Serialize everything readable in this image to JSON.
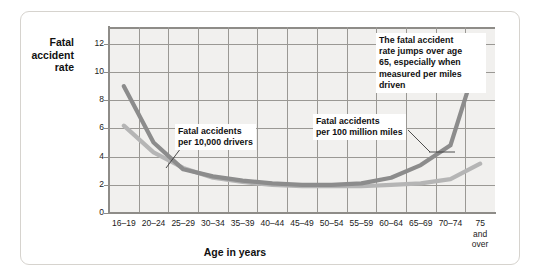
{
  "figure": {
    "y_axis_title": "Fatal\naccident\nrate",
    "x_axis_title": "Age in years"
  },
  "annotations": {
    "drivers": "Fatal accidents\nper 10,000 drivers",
    "miles": "Fatal accidents\nper 100 million miles",
    "jump": "The fatal accident\nrate jumps over age\n65, especially when\nmeasured per miles\ndriven"
  },
  "colors": {
    "series_miles": "#8c8c8c",
    "series_drivers": "#b5b5b5",
    "plot_background": "#f1f0ee",
    "grid": "#9a9894",
    "axis": "#8e8c88",
    "card_border": "#d6d3ce"
  },
  "chart_data": {
    "type": "line",
    "title": "",
    "xlabel": "Age in years",
    "ylabel": "Fatal accident rate",
    "ylim": [
      0,
      13.2
    ],
    "yticks": [
      0,
      2,
      4,
      6,
      8,
      10,
      12
    ],
    "grid": true,
    "legend": "annotated-callouts",
    "categories": [
      "16–19",
      "20–24",
      "25–29",
      "30–34",
      "35–39",
      "40–44",
      "45–49",
      "50–54",
      "55–59",
      "60–64",
      "65–69",
      "70–74",
      "75\nand\nover"
    ],
    "series": [
      {
        "name": "Fatal accidents per 100 million miles",
        "color": "#8c8c8c",
        "values": [
          9.0,
          5.0,
          3.1,
          2.6,
          2.3,
          2.1,
          2.0,
          2.0,
          2.1,
          2.5,
          3.4,
          4.8,
          11.5
        ]
      },
      {
        "name": "Fatal accidents per 10,000 drivers",
        "color": "#b5b5b5",
        "values": [
          6.2,
          4.3,
          3.2,
          2.5,
          2.2,
          2.0,
          1.9,
          1.9,
          1.9,
          2.0,
          2.1,
          2.4,
          3.5
        ]
      }
    ]
  }
}
